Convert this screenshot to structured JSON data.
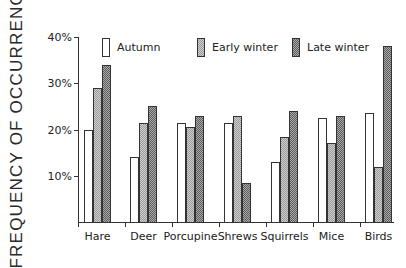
{
  "chart_data": {
    "type": "bar",
    "title": "",
    "xlabel": "",
    "ylabel": "FREQUENCY OF OCCURRENCE",
    "ylim": [
      0,
      40
    ],
    "yticks": [
      "10%",
      "20%",
      "30%",
      "40%"
    ],
    "ytick_values": [
      10,
      20,
      30,
      40
    ],
    "grid": false,
    "legend_position": "top",
    "categories": [
      "Hare",
      "Deer",
      "Porcupine",
      "Shrews",
      "Squirrels",
      "Mice",
      "Birds"
    ],
    "series": [
      {
        "name": "Autumn",
        "pattern": "white",
        "values": [
          20,
          14,
          21.5,
          21.5,
          13,
          22.5,
          23.5
        ]
      },
      {
        "name": "Early winter",
        "pattern": "light-stipple",
        "values": [
          29,
          21.5,
          20.5,
          23,
          18.5,
          17,
          12
        ]
      },
      {
        "name": "Late winter",
        "pattern": "dark-stipple",
        "values": [
          34,
          25,
          23,
          8.5,
          24,
          23,
          38
        ]
      }
    ]
  },
  "colors": {
    "axis": "#333333",
    "autumn": "#ffffff",
    "early_winter": "#b8b8b8",
    "late_winter": "#838383"
  }
}
